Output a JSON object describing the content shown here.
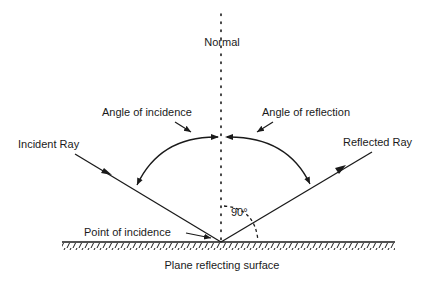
{
  "diagram": {
    "labels": {
      "normal": "Normal",
      "angle_of_incidence": "Angle of incidence",
      "angle_of_reflection": "Angle of reflection",
      "incident_ray": "Incident Ray",
      "reflected_ray": "Reflected Ray",
      "right_angle": "90°",
      "point_of_incidence": "Point of incidence",
      "surface": "Plane reflecting surface"
    },
    "colors": {
      "ink": "#1a1a1a",
      "background": "#ffffff"
    }
  }
}
